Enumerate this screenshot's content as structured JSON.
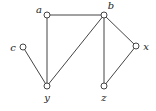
{
  "graph": {
    "type": "undirected",
    "nodes": [
      {
        "id": "a",
        "label": "a",
        "x": 47,
        "y": 15,
        "lx": 39,
        "ly": 13
      },
      {
        "id": "b",
        "label": "b",
        "x": 104,
        "y": 15,
        "lx": 111,
        "ly": 9
      },
      {
        "id": "c",
        "label": "c",
        "x": 23,
        "y": 47,
        "lx": 13,
        "ly": 51
      },
      {
        "id": "x",
        "label": "x",
        "x": 136,
        "y": 46,
        "lx": 146,
        "ly": 50
      },
      {
        "id": "y",
        "label": "y",
        "x": 47,
        "y": 86,
        "lx": 47,
        "ly": 101
      },
      {
        "id": "z",
        "label": "z",
        "x": 104,
        "y": 86,
        "lx": 104,
        "ly": 101
      }
    ],
    "edges": [
      {
        "from": "a",
        "to": "b"
      },
      {
        "from": "a",
        "to": "y"
      },
      {
        "from": "c",
        "to": "y"
      },
      {
        "from": "y",
        "to": "b"
      },
      {
        "from": "b",
        "to": "z"
      },
      {
        "from": "b",
        "to": "x"
      },
      {
        "from": "x",
        "to": "z"
      }
    ],
    "colors": {
      "stroke": "#444444",
      "node_fill": "#ffffff",
      "label": "#222222"
    }
  }
}
